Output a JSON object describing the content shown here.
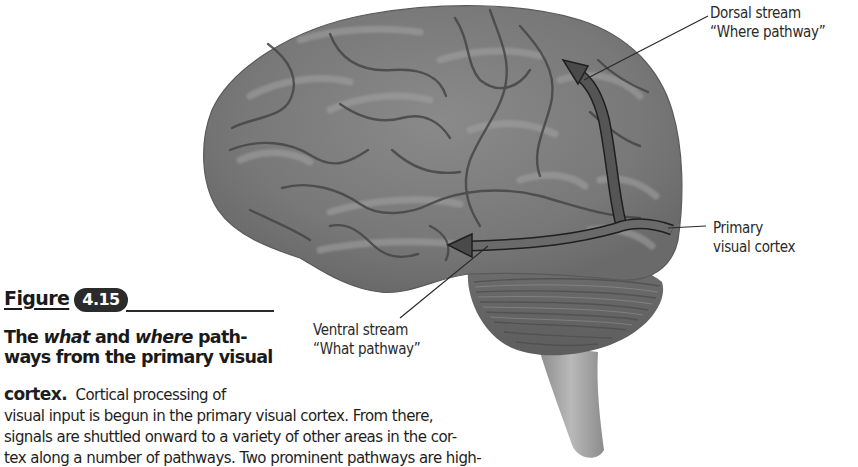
{
  "figure": {
    "word": "Figure",
    "number": "4.15",
    "title_parts": {
      "pre": "The ",
      "what": "what",
      "mid": " and ",
      "where": "where",
      "post1": " path-",
      "line2": "ways from the primary visual"
    },
    "caption": {
      "lead_bold": "cortex.",
      "lead_text": "  Cortical processing of",
      "lines": [
        "visual input is begun in the primary visual cortex. From there,",
        "signals are shuttled onward to a variety of other areas in the cor-",
        "tex along a number of pathways. Two prominent pathways are high-"
      ]
    }
  },
  "labels": {
    "dorsal": {
      "line1": "Dorsal stream",
      "line2": "“Where pathway”"
    },
    "primary": {
      "line1": "Primary",
      "line2": "visual cortex"
    },
    "ventral": {
      "line1": "Ventral stream",
      "line2": "“What pathway”"
    }
  },
  "colors": {
    "brain_fill": "#7b7b7b",
    "brain_sulcus": "#474747",
    "brain_highlight": "#9c9c9c",
    "arrow_fill": "#5a5a5a",
    "arrow_outline": "#1f1f1f",
    "badge": "#2b2b2b"
  }
}
